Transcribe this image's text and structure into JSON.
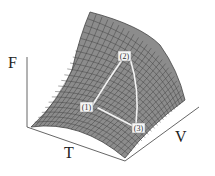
{
  "figure": {
    "axes": {
      "vertical": {
        "label": "F"
      },
      "front": {
        "label": "T"
      },
      "side": {
        "label": "V"
      }
    },
    "surface": {
      "fill_color": "#8c8c8c",
      "grid_color": "#3a3a3a",
      "grid_rows": 20,
      "grid_cols": 24
    },
    "path": {
      "color": "#f2f2f2",
      "points": [
        {
          "id": "1",
          "label": "(1)"
        },
        {
          "id": "2",
          "label": "(2)"
        },
        {
          "id": "3",
          "label": "(3)"
        }
      ]
    }
  }
}
